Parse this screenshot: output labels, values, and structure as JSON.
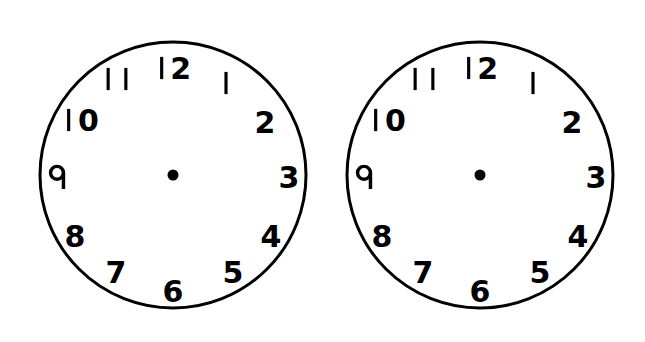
{
  "page": {
    "width": 645,
    "height": 342,
    "background_color": "#ffffff",
    "ink_color": "#000000"
  },
  "style": {
    "face_stroke_color": "#000000",
    "face_fill_color": "#ffffff",
    "face_stroke_width": 3,
    "numeral_color": "#000000",
    "numeral_font_size": 30,
    "center_dot_color": "#000000",
    "center_dot_radius": 5.5,
    "numeral_radius_ratio": 0.8
  },
  "clocks": [
    {
      "id": "clock-left",
      "name": "left-clock-face",
      "center_x": 173,
      "center_y": 175,
      "radius": 133,
      "has_hands": false,
      "hour_hand": null,
      "minute_hand": null,
      "center_dot": true,
      "hours": [
        {
          "label": "12",
          "hour": 12,
          "angle_deg": 0,
          "x": 173,
          "y": 68,
          "glyph": "stroke-two"
        },
        {
          "label": "1",
          "hour": 1,
          "angle_deg": 30,
          "x": 226,
          "y": 83,
          "glyph": "stroke"
        },
        {
          "label": "2",
          "hour": 2,
          "angle_deg": 60,
          "x": 265,
          "y": 122,
          "glyph": "digit"
        },
        {
          "label": "3",
          "hour": 3,
          "angle_deg": 90,
          "x": 289,
          "y": 177,
          "glyph": "digit"
        },
        {
          "label": "4",
          "hour": 4,
          "angle_deg": 120,
          "x": 271,
          "y": 236,
          "glyph": "digit"
        },
        {
          "label": "5",
          "hour": 5,
          "angle_deg": 150,
          "x": 233,
          "y": 272,
          "glyph": "digit"
        },
        {
          "label": "6",
          "hour": 6,
          "angle_deg": 180,
          "x": 173,
          "y": 291,
          "glyph": "digit"
        },
        {
          "label": "7",
          "hour": 7,
          "angle_deg": 210,
          "x": 116,
          "y": 272,
          "glyph": "digit"
        },
        {
          "label": "8",
          "hour": 8,
          "angle_deg": 240,
          "x": 75,
          "y": 236,
          "glyph": "digit"
        },
        {
          "label": "9",
          "hour": 9,
          "angle_deg": 270,
          "x": 57,
          "y": 177,
          "glyph": "nine-descender"
        },
        {
          "label": "10",
          "hour": 10,
          "angle_deg": 300,
          "x": 80,
          "y": 120,
          "glyph": "stroke-zero"
        },
        {
          "label": "11",
          "hour": 11,
          "angle_deg": 330,
          "x": 117,
          "y": 79,
          "glyph": "stroke-stroke"
        }
      ]
    },
    {
      "id": "clock-right",
      "name": "right-clock-face",
      "center_x": 480,
      "center_y": 175,
      "radius": 133,
      "has_hands": false,
      "hour_hand": null,
      "minute_hand": null,
      "center_dot": true,
      "hours": [
        {
          "label": "12",
          "hour": 12,
          "angle_deg": 0,
          "x": 480,
          "y": 68,
          "glyph": "stroke-two"
        },
        {
          "label": "1",
          "hour": 1,
          "angle_deg": 30,
          "x": 533,
          "y": 83,
          "glyph": "stroke"
        },
        {
          "label": "2",
          "hour": 2,
          "angle_deg": 60,
          "x": 572,
          "y": 122,
          "glyph": "digit"
        },
        {
          "label": "3",
          "hour": 3,
          "angle_deg": 90,
          "x": 596,
          "y": 177,
          "glyph": "digit"
        },
        {
          "label": "4",
          "hour": 4,
          "angle_deg": 120,
          "x": 578,
          "y": 236,
          "glyph": "digit"
        },
        {
          "label": "5",
          "hour": 5,
          "angle_deg": 150,
          "x": 540,
          "y": 272,
          "glyph": "digit"
        },
        {
          "label": "6",
          "hour": 6,
          "angle_deg": 180,
          "x": 480,
          "y": 291,
          "glyph": "digit"
        },
        {
          "label": "7",
          "hour": 7,
          "angle_deg": 210,
          "x": 423,
          "y": 272,
          "glyph": "digit"
        },
        {
          "label": "8",
          "hour": 8,
          "angle_deg": 240,
          "x": 382,
          "y": 236,
          "glyph": "digit"
        },
        {
          "label": "9",
          "hour": 9,
          "angle_deg": 270,
          "x": 364,
          "y": 177,
          "glyph": "nine-descender"
        },
        {
          "label": "10",
          "hour": 10,
          "angle_deg": 300,
          "x": 387,
          "y": 120,
          "glyph": "stroke-zero"
        },
        {
          "label": "11",
          "hour": 11,
          "angle_deg": 330,
          "x": 424,
          "y": 79,
          "glyph": "stroke-stroke"
        }
      ]
    }
  ]
}
